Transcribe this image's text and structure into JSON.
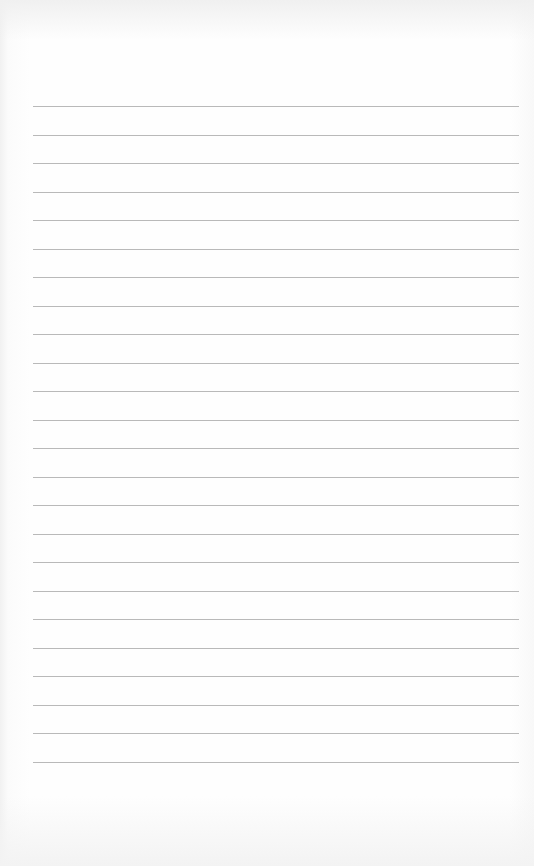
{
  "paper": {
    "type": "lined-paper",
    "line_count": 24,
    "first_line_y": 106,
    "line_spacing": 28.5,
    "line_left": 33,
    "line_width": 486,
    "line_color": "#b9b9b9",
    "background_color": "#fdfdfd"
  }
}
